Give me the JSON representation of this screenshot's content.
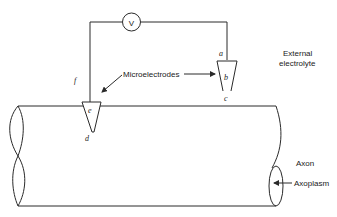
{
  "diagram": {
    "voltmeter": {
      "symbol": "V"
    },
    "point_labels": {
      "a": "a",
      "b": "b",
      "c": "c",
      "d": "d",
      "e": "e",
      "f": "f"
    },
    "labels": {
      "microelectrodes": "Microelectrodes",
      "external_line1": "External",
      "external_line2": "electrolyte",
      "axon": "Axon",
      "axoplasm": "Axoplasm"
    },
    "colors": {
      "stroke": "#2a2a2a",
      "background": "#ffffff"
    }
  }
}
